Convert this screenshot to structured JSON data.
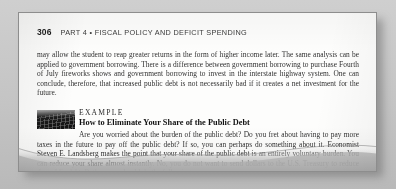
{
  "page": {
    "folio": "306",
    "running_title": "PART 4  •  FISCAL POLICY AND DEFICIT SPENDING"
  },
  "body": {
    "paragraph": "may allow the student to reap greater returns in the form of higher income later. The same analysis can be applied to government borrowing. There is a difference between government borrowing to purchase Fourth of July fireworks shows and government borrowing to invest in the interstate highway system. One can conclude, therefore, that increased public debt is not necessarily bad if it creates a net investment for the future."
  },
  "example": {
    "kicker": "EXAMPLE",
    "title": "How to Eliminate Your Share of the Public Debt",
    "figure_alt": "computer-keyboard-photo",
    "text": "Are you worried about the burden of the public debt? Do you fret about having to pay more taxes in the future to pay off the public debt? If so, you can perhaps do something about it. Economist Steven E. Landsberg makes the point that your share of the public debt is an entirely voluntary burden. You can reduce your share almost instantly. No, you do not want to send dollars to the U.S. Treasury to reduce the public debt. Rather, you should do the following:"
  },
  "colors": {
    "page": "#fdfdfc",
    "backdrop": "#c4c4c4",
    "ink": "#303030",
    "heading_ink": "#121212"
  }
}
